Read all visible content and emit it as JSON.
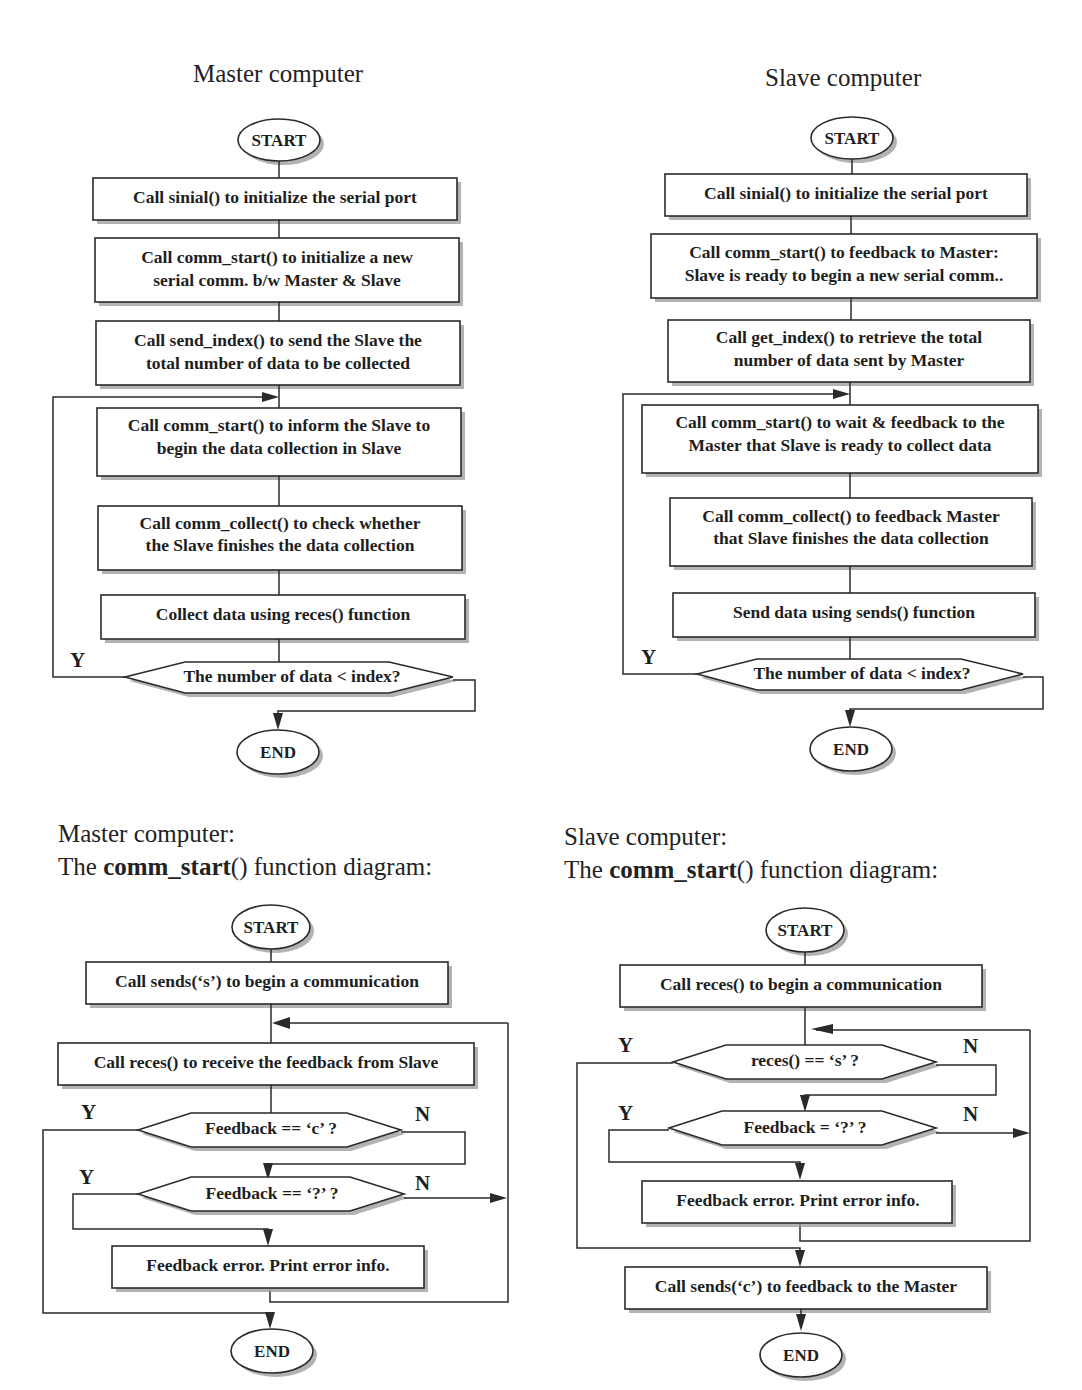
{
  "top_left": {
    "title": "Master computer",
    "start": "START",
    "end": "END",
    "steps": [
      [
        "Call sinial() to initialize the serial port"
      ],
      [
        "Call comm_start() to initialize a new",
        "serial comm. b/w Master & Slave"
      ],
      [
        "Call send_index() to send the Slave the",
        "total number of data to be collected"
      ],
      [
        "Call comm_start() to inform the Slave to",
        "begin the data collection in Slave"
      ],
      [
        "Call comm_collect() to check whether",
        "the Slave  finishes the data collection"
      ],
      [
        "Collect data using reces() function"
      ]
    ],
    "decision": "The number of data < index?",
    "yes_label": "Y"
  },
  "top_right": {
    "title": "Slave computer",
    "start": "START",
    "end": "END",
    "steps": [
      [
        "Call sinial() to initialize the serial port"
      ],
      [
        "Call comm_start() to feedback to Master:",
        "Slave is ready to begin a new serial comm.."
      ],
      [
        "Call get_index() to retrieve the total",
        "number of data sent by Master"
      ],
      [
        "Call comm_start() to wait & feedback to the",
        "Master that Slave is ready to collect data"
      ],
      [
        "Call comm_collect() to feedback Master",
        "that Slave finishes the data collection"
      ],
      [
        "Send data using sends() function"
      ]
    ],
    "decision": "The number of data < index?",
    "yes_label": "Y"
  },
  "bottom_left": {
    "title_line1": "Master computer:",
    "title_prefix": "The ",
    "title_bold": "comm_start",
    "title_suffix": "() function diagram:",
    "start": "START",
    "end": "END",
    "step_begin": "Call sends(‘s’) to begin a communication",
    "step_receive": "Call reces() to receive the feedback from Slave",
    "decision_1": "Feedback == ‘c’ ?",
    "decision_2": "Feedback == ‘?’ ?",
    "step_error": "Feedback error. Print error  info.",
    "yes_label": "Y",
    "no_label": "N"
  },
  "bottom_right": {
    "title_line1": "Slave computer:",
    "title_prefix": "The ",
    "title_bold": "comm_start",
    "title_suffix": "() function diagram:",
    "start": "START",
    "end": "END",
    "step_begin": "Call reces() to begin a communication",
    "decision_1": "reces() == ‘s’ ?",
    "decision_2": "Feedback = ‘?’ ?",
    "step_error": "Feedback error. Print error  info.",
    "step_feedback": "Call sends(‘c’) to feedback to the Master",
    "yes_label": "Y",
    "no_label": "N"
  }
}
